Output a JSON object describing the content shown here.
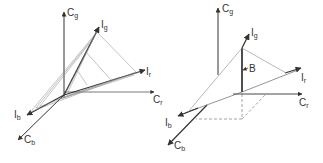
{
  "diagrams": [
    {
      "name": "left-primaries-diagram",
      "axes": {
        "cg": {
          "base": "C",
          "sub": "g"
        },
        "cr": {
          "base": "C",
          "sub": "r"
        },
        "cb": {
          "base": "C",
          "sub": "b"
        }
      },
      "vectors": {
        "ig": {
          "base": "I",
          "sub": "g"
        },
        "ir": {
          "base": "I",
          "sub": "r"
        },
        "ib": {
          "base": "I",
          "sub": "b"
        }
      }
    },
    {
      "name": "right-projection-diagram",
      "axes": {
        "cg": {
          "base": "C",
          "sub": "g"
        },
        "cr": {
          "base": "C",
          "sub": "r"
        },
        "cb": {
          "base": "C",
          "sub": "b"
        }
      },
      "vectors": {
        "ig": {
          "base": "I",
          "sub": "g"
        },
        "ir": {
          "base": "I",
          "sub": "r"
        },
        "ib": {
          "base": "I",
          "sub": "b"
        }
      },
      "point_label": "B"
    }
  ],
  "colors": {
    "stroke": "#333333",
    "light": "#888888",
    "background": "#ffffff"
  }
}
